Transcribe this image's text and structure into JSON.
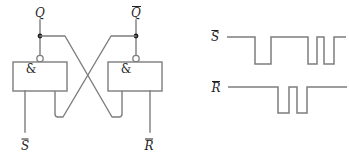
{
  "figure": {
    "background": "#ffffff",
    "line_color": "#7d7d7d",
    "text_color": "#1f1f1f"
  },
  "circuit": {
    "output_labels": {
      "q": "Q",
      "qbar": "Q"
    },
    "input_labels": {
      "sbar": "S",
      "rbar": "R"
    },
    "gates": [
      {
        "label": "&"
      },
      {
        "label": "&"
      }
    ]
  },
  "chart_data": {
    "type": "digital-timing",
    "signals": [
      {
        "name": "S-bar",
        "label": "S",
        "overline": true,
        "initial_level": 1,
        "x_start": 227,
        "x_end": 346,
        "y_high": 37,
        "y_low": 64,
        "transitions": [
          255,
          271,
          308,
          317,
          324,
          334
        ]
      },
      {
        "name": "R-bar",
        "label": "R",
        "overline": true,
        "initial_level": 1,
        "x_start": 228,
        "x_end": 347,
        "y_high": 87,
        "y_low": 113,
        "transitions": [
          278,
          289,
          297,
          307
        ]
      }
    ]
  }
}
